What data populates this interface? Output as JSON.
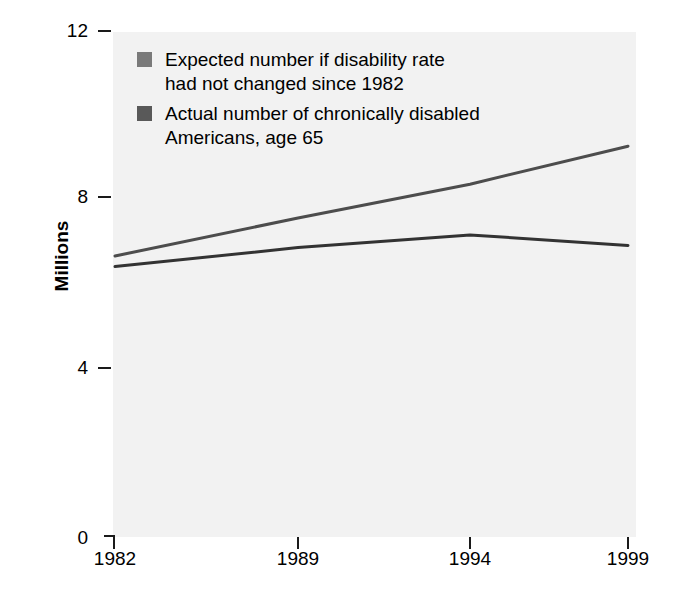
{
  "chart_data": {
    "type": "line",
    "title": "",
    "xlabel": "",
    "ylabel": "Millions",
    "x": [
      1982,
      1989,
      1994,
      1999
    ],
    "categories": [
      "1982",
      "1989",
      "1994",
      "1999"
    ],
    "series": [
      {
        "name": "Expected number if disability rate had not changed since 1982",
        "values": [
          6.65,
          7.55,
          8.35,
          9.25
        ],
        "color": "#4d4d4d"
      },
      {
        "name": "Actual number of chronically disabled Americans, age 65",
        "values": [
          6.4,
          6.85,
          7.15,
          6.9
        ],
        "color": "#333333"
      }
    ],
    "xlim": [
      1982,
      1999
    ],
    "ylim": [
      0,
      12
    ],
    "yticks": [
      0,
      4,
      8,
      12
    ],
    "ytick_labels": [
      "0",
      "4",
      "8",
      "12"
    ],
    "xticks": [
      1982,
      1989,
      1994,
      1999
    ],
    "xtick_labels": [
      "1982",
      "1989",
      "1994",
      "1999"
    ],
    "grid": false,
    "legend_position": "upper left",
    "plot_background": "#f2f2f2"
  },
  "axes": {
    "y_title": "Millions",
    "y_ticks": [
      {
        "label": "12",
        "value": 12
      },
      {
        "label": "8",
        "value": 8
      },
      {
        "label": "4",
        "value": 4
      },
      {
        "label": "0",
        "value": 0
      }
    ],
    "x_ticks": [
      {
        "label": "1982",
        "value": 1982
      },
      {
        "label": "1989",
        "value": 1989
      },
      {
        "label": "1994",
        "value": 1994
      },
      {
        "label": "1999",
        "value": 1999
      }
    ]
  },
  "legend": {
    "entries": [
      {
        "label": "Expected number if disability rate\nhad not changed since 1982",
        "swatch_color": "#7a7a7a"
      },
      {
        "label": "Actual number of chronically disabled\nAmericans, age 65",
        "swatch_color": "#595959"
      }
    ]
  }
}
